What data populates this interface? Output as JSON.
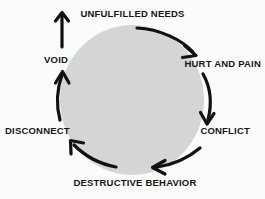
{
  "diagram": {
    "type": "cycle",
    "direction": "clockwise",
    "background_color": "#fbfbfb",
    "ellipse_color": "#d5d5d5",
    "arrow_color": "#111111",
    "text_color": "#161616",
    "stages": [
      {
        "id": "unfulfilled-needs",
        "label": "UNFULFILLED NEEDS",
        "position": "top"
      },
      {
        "id": "hurt-and-pain",
        "label": "HURT AND PAIN",
        "position": "top-right"
      },
      {
        "id": "conflict",
        "label": "CONFLICT",
        "position": "bottom-right"
      },
      {
        "id": "destructive-behavior",
        "label": "DESTRUCTIVE BEHAVIOR",
        "position": "bottom"
      },
      {
        "id": "disconnect",
        "label": "DISCONNECT",
        "position": "bottom-left"
      },
      {
        "id": "void",
        "label": "VOID",
        "position": "top-left"
      }
    ],
    "arrows": [
      {
        "id": "arrow-needs-to-hurt",
        "from": "unfulfilled-needs",
        "to": "hurt-and-pain",
        "shape": "curve-down-right"
      },
      {
        "id": "arrow-hurt-to-conflict",
        "from": "hurt-and-pain",
        "to": "conflict",
        "shape": "curve-down"
      },
      {
        "id": "arrow-conflict-to-destructive",
        "from": "conflict",
        "to": "destructive-behavior",
        "shape": "curve-down-left"
      },
      {
        "id": "arrow-destructive-to-disconnect",
        "from": "destructive-behavior",
        "to": "disconnect",
        "shape": "curve-up-left"
      },
      {
        "id": "arrow-disconnect-to-void",
        "from": "disconnect",
        "to": "void",
        "shape": "curve-up"
      },
      {
        "id": "arrow-void-to-needs",
        "from": "void",
        "to": "unfulfilled-needs",
        "shape": "straight-up"
      }
    ]
  }
}
